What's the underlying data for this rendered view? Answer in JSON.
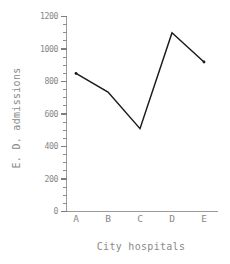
{
  "chart_data": {
    "type": "line",
    "title": "",
    "subtitle": "",
    "xlabel": "City hospitals",
    "ylabel": "E. D. admissions",
    "categories": [
      "A",
      "B",
      "C",
      "D",
      "E"
    ],
    "values": [
      850,
      735,
      510,
      1100,
      920
    ],
    "series": [
      {
        "name": "E. D. admissions",
        "values": [
          850,
          735,
          510,
          1100,
          920
        ]
      }
    ],
    "ylim": [
      0,
      1200
    ],
    "y_ticks": [
      0,
      200,
      400,
      600,
      800,
      1000,
      1200
    ],
    "y_tick_labels": [
      "0",
      "200",
      "400",
      "600",
      "800",
      "1000",
      "1200"
    ],
    "y_minor_tick_step": 50,
    "x_ticks": [
      "A",
      "B",
      "C",
      "D",
      "E"
    ],
    "grid": false,
    "legend": false,
    "legend_position": "none",
    "line_color": "#1a1a1a",
    "axis_color": "#9a9a9a",
    "text_color": "#888888",
    "background_color": "#ffffff",
    "markers": false,
    "annotations": []
  },
  "axes": {
    "y_title": "E. D. admissions",
    "x_title": "City hospitals"
  }
}
